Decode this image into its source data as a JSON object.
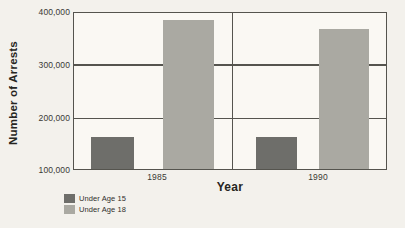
{
  "chart_data": {
    "type": "bar",
    "title": "",
    "xlabel": "Year",
    "ylabel": "Number of Arrests",
    "categories": [
      "1985",
      "1990"
    ],
    "series": [
      {
        "name": "Under Age 15",
        "values": [
          160000,
          160000
        ],
        "color": "#6e6e6a"
      },
      {
        "name": "Under Age 18",
        "values": [
          382000,
          365000
        ],
        "color": "#aaa9a2"
      }
    ],
    "ylim": [
      100000,
      400000
    ],
    "yticks": [
      100000,
      200000,
      300000,
      400000
    ],
    "ytick_labels": [
      "100,000",
      "200,000",
      "300,000",
      "400,000"
    ],
    "grid": true,
    "legend_position": "bottom-left"
  },
  "axes": {
    "y_title": "Number of Arrests",
    "x_title": "Year",
    "y_tick_labels": [
      "400,000",
      "300,000",
      "200,000",
      "100,000"
    ],
    "x_tick_labels": [
      "1985",
      "1990"
    ]
  },
  "legend": {
    "items": [
      {
        "label": "Under Age 15",
        "color": "#6e6e6a"
      },
      {
        "label": "Under Age 18",
        "color": "#aaa9a2"
      }
    ]
  }
}
